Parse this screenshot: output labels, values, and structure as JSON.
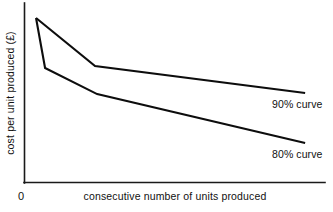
{
  "chart_data": {
    "type": "line",
    "title": "",
    "subtitle": "",
    "xlabel": "consecutive number of units produced",
    "ylabel": "cost per unit produced (£)",
    "origin_label": "0",
    "grid": false,
    "legend_position": "inline-right",
    "axis_style": "L-shaped (left and bottom spines only)",
    "xlim": [
      0,
      100
    ],
    "ylim": [
      0,
      100
    ],
    "x_ticks": [],
    "y_ticks": [],
    "x_tick_labels": [],
    "y_tick_labels": [],
    "annotations": [
      {
        "text": "90% curve",
        "x": 82,
        "y": 50
      },
      {
        "text": "80% curve",
        "x": 82,
        "y": 22
      }
    ],
    "series": [
      {
        "name": "90% curve",
        "label": "90% curve",
        "color": "#0d0d0d",
        "x": [
          4,
          23.6,
          93.4
        ],
        "y": [
          91.7,
          65.0,
          50.0
        ],
        "points": [
          {
            "x": 4,
            "y": 91.7
          },
          {
            "x": 23.6,
            "y": 65.0
          },
          {
            "x": 93.4,
            "y": 50.0
          }
        ]
      },
      {
        "name": "80% curve",
        "label": "80% curve",
        "color": "#0d0d0d",
        "x": [
          4,
          7,
          24.3,
          93.4
        ],
        "y": [
          91.7,
          63.9,
          49.4,
          22.2
        ],
        "points": [
          {
            "x": 4,
            "y": 91.7
          },
          {
            "x": 7,
            "y": 63.9
          },
          {
            "x": 24.3,
            "y": 49.4
          },
          {
            "x": 93.4,
            "y": 22.2
          }
        ]
      }
    ]
  },
  "figure": {
    "background_color": "#ffffff",
    "line_color": "#0d0d0d",
    "axis_color": "#1a1a1a"
  }
}
